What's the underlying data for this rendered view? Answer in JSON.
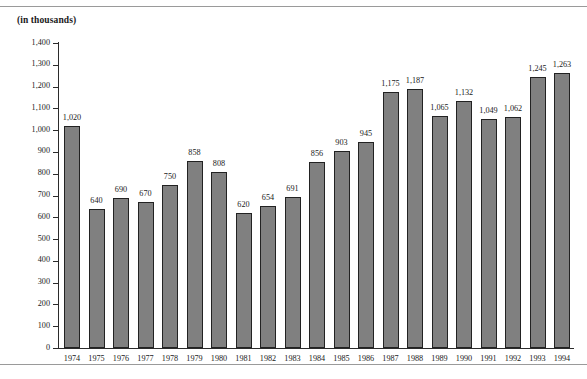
{
  "figure": {
    "units_caption": "(in thousands)"
  },
  "chart_data": {
    "type": "bar",
    "title": "",
    "subtitle": "",
    "xlabel": "",
    "ylabel": "(in thousands)",
    "ylim": [
      0,
      1400
    ],
    "ytick_step": 100,
    "ytick_labels": [
      "1,400",
      "1,300",
      "1,200",
      "1,100",
      "1,000",
      "900",
      "800",
      "700",
      "600",
      "500",
      "400",
      "300",
      "200",
      "100",
      "0"
    ],
    "ytick_values": [
      1400,
      1300,
      1200,
      1100,
      1000,
      900,
      800,
      700,
      600,
      500,
      400,
      300,
      200,
      100,
      0
    ],
    "grid": false,
    "legend": null,
    "bar_color": "#808080",
    "bar_edge_color": "#222222",
    "categories": [
      "1974",
      "1975",
      "1976",
      "1977",
      "1978",
      "1979",
      "1980",
      "1981",
      "1982",
      "1983",
      "1984",
      "1985",
      "1986",
      "1987",
      "1988",
      "1989",
      "1990",
      "1991",
      "1992",
      "1993",
      "1994"
    ],
    "values": [
      1020,
      640,
      690,
      670,
      750,
      858,
      808,
      620,
      654,
      691,
      856,
      903,
      945,
      1175,
      1187,
      1065,
      1132,
      1049,
      1062,
      1245,
      1263
    ],
    "value_labels": [
      "1,020",
      "640",
      "690",
      "670",
      "750",
      "858",
      "808",
      "620",
      "654",
      "691",
      "856",
      "903",
      "945",
      "1,175",
      "1,187",
      "1,065",
      "1,132",
      "1,049",
      "1,062",
      "1,245",
      "1,263"
    ]
  }
}
